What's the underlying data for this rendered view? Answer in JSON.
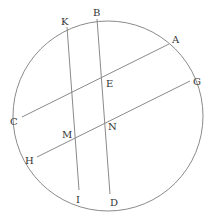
{
  "diagram": {
    "type": "circle-with-chords",
    "colors": {
      "stroke": "#8a8a8a",
      "label": "#333333",
      "background": "#ffffff"
    },
    "circle": {
      "cx": 108,
      "cy": 116,
      "r": 95
    },
    "points": {
      "K": {
        "label": "K",
        "x": 67,
        "y": 27
      },
      "B": {
        "label": "B",
        "x": 97,
        "y": 19
      },
      "A": {
        "label": "A",
        "x": 169,
        "y": 44
      },
      "G": {
        "label": "G",
        "x": 190,
        "y": 81
      },
      "C": {
        "label": "C",
        "x": 22,
        "y": 117
      },
      "H": {
        "label": "H",
        "x": 37,
        "y": 157
      },
      "I": {
        "label": "I",
        "x": 79,
        "y": 190
      },
      "D": {
        "label": "D",
        "x": 110,
        "y": 194
      },
      "E": {
        "label": "E",
        "x": 103,
        "y": 79
      },
      "M": {
        "label": "M",
        "x": 76,
        "y": 137
      },
      "N": {
        "label": "N",
        "x": 106,
        "y": 122
      }
    },
    "chords": [
      {
        "name": "KI",
        "from": "K",
        "to": "I"
      },
      {
        "name": "BD",
        "from": "B",
        "to": "D"
      },
      {
        "name": "AC",
        "from": "A",
        "to": "C"
      },
      {
        "name": "GH",
        "from": "G",
        "to": "H"
      }
    ],
    "labels": {
      "K": {
        "text": "K",
        "x": 61,
        "y": 25
      },
      "B": {
        "text": "B",
        "x": 93,
        "y": 16
      },
      "A": {
        "text": "A",
        "x": 172,
        "y": 43
      },
      "E": {
        "text": "E",
        "x": 106,
        "y": 87
      },
      "G": {
        "text": "G",
        "x": 193,
        "y": 85
      },
      "C": {
        "text": "C",
        "x": 10,
        "y": 125
      },
      "M": {
        "text": "M",
        "x": 62,
        "y": 138
      },
      "N": {
        "text": "N",
        "x": 108,
        "y": 130
      },
      "H": {
        "text": "H",
        "x": 25,
        "y": 164
      },
      "I": {
        "text": "I",
        "x": 76,
        "y": 203
      },
      "D": {
        "text": "D",
        "x": 110,
        "y": 206
      }
    }
  }
}
